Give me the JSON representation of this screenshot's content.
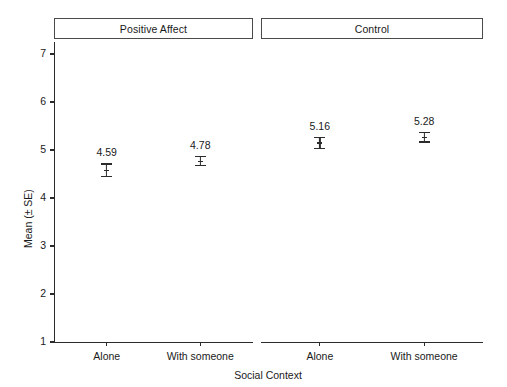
{
  "chart_data": {
    "type": "scatter",
    "title": "",
    "xlabel": "Social Context",
    "ylabel": "Mean (± SE)",
    "ylim": [
      1,
      7.25
    ],
    "yticks": [
      1,
      2,
      3,
      4,
      5,
      6,
      7
    ],
    "ytick_labels": [
      "1",
      "2",
      "3",
      "4",
      "5",
      "6",
      "7"
    ],
    "categories": [
      "Alone",
      "With someone"
    ],
    "grid": false,
    "legend": "none",
    "error_type": "SE",
    "panels": [
      {
        "label": "Positive Affect",
        "points": [
          {
            "category": "Alone",
            "value": 4.59,
            "label": "4.59",
            "se": 0.13
          },
          {
            "category": "With someone",
            "value": 4.78,
            "label": "4.78",
            "se": 0.09
          }
        ]
      },
      {
        "label": "Control",
        "points": [
          {
            "category": "Alone",
            "value": 5.16,
            "label": "5.16",
            "se": 0.11
          },
          {
            "category": "With someone",
            "value": 5.28,
            "label": "5.28",
            "se": 0.1
          }
        ]
      }
    ]
  },
  "figure": {
    "background_color": "#ffffff",
    "foreground_color": "#1a1a1a",
    "axis_color": "#2b2b2b",
    "strip_border_color": "#4a4a4a"
  }
}
